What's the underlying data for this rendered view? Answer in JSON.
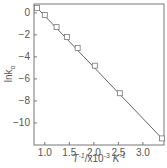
{
  "chart_data": {
    "type": "scatter",
    "title": "",
    "xlabel": "T^-1/x10^-3 K^-1",
    "xlabel_parts": {
      "base": "T",
      "sup1": "-1",
      "mid": "/x10",
      "sup2": "-3",
      "unit": " K",
      "sup3": "-1"
    },
    "ylabel": "ln k_o",
    "ylabel_parts": {
      "base": "lnk",
      "sub": "o"
    },
    "xlim": [
      0.78,
      3.43
    ],
    "ylim": [
      -12.0,
      0.8
    ],
    "xticks": [
      1.0,
      1.5,
      2.0,
      2.5,
      3.0
    ],
    "xtick_labels": [
      "1.0",
      "1.5",
      "2.0",
      "2.5",
      "3.0"
    ],
    "yticks": [
      0,
      -2,
      -4,
      -6,
      -8,
      -10
    ],
    "ytick_labels": [
      "0",
      "-2",
      "-4",
      "-6",
      "-8",
      "-10"
    ],
    "grid": false,
    "legend": null,
    "series": [
      {
        "name": "data",
        "marker": "open-square",
        "x": [
          0.84,
          1.0,
          1.24,
          1.45,
          1.67,
          2.02,
          2.53,
          3.39
        ],
        "y": [
          0.45,
          -0.2,
          -1.3,
          -2.2,
          -3.2,
          -4.8,
          -7.3,
          -11.4
        ]
      }
    ],
    "fit_line": {
      "x": [
        0.8,
        3.42
      ],
      "y": [
        0.65,
        -11.55
      ]
    },
    "colors": {
      "axis": "#777777",
      "line": "#666666",
      "marker": "#777777"
    }
  }
}
